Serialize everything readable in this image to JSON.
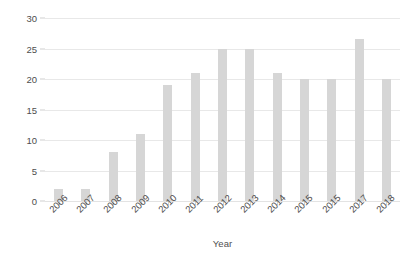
{
  "chart_data": {
    "type": "bar",
    "title": "",
    "xlabel": "Year",
    "ylabel": "No. of Completed Trials",
    "categories": [
      "2006",
      "2007",
      "2008",
      "2009",
      "2010",
      "2011",
      "2012",
      "2013",
      "2014",
      "2015",
      "2015",
      "2017",
      "2018"
    ],
    "values": [
      2,
      2,
      8,
      11,
      19,
      21,
      25,
      25,
      21,
      20,
      20,
      26.5,
      20
    ],
    "ylim": [
      0,
      30
    ],
    "yticks": [
      0,
      5,
      10,
      15,
      20,
      25,
      30
    ],
    "ytick_labels": [
      "0",
      "5",
      "10",
      "15",
      "20",
      "25",
      "30"
    ],
    "grid": true,
    "legend": false,
    "bar_color": "#d6d6d6",
    "gridline_color": "#e8e8e8",
    "text_color": "#4d4d4d",
    "background_color": "#ffffff",
    "xtick_rotation": -45
  }
}
